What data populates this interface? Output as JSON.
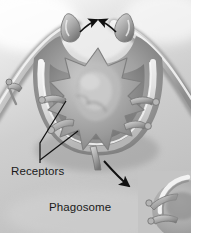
{
  "figure": {
    "kind": "scientific-illustration",
    "rendering": "grayscale-airbrush",
    "width": 200,
    "height": 233,
    "background_color": "#ffffff",
    "field_color": "#c9c9c9",
    "membrane_color": "#8f8f8f",
    "membrane_highlight_color": "#efefef",
    "particle_color": "#a6a6a6",
    "particle_shadow_color": "#6e6e6e",
    "annotation_color": "#111111",
    "label_color": "#1a1a1a"
  },
  "labels": {
    "receptors": "Receptors",
    "phagosome": "Phagosome"
  },
  "annotations": {
    "closure_arrow_left": "arrow-pointing-right-inward",
    "closure_arrow_right": "arrow-pointing-left-inward",
    "phagosome_arrow": "curved-arrow-pointing-down-right",
    "receptor_leader_upper": "leader-line-to-upper-receptor",
    "receptor_leader_lower": "leader-line-to-lower-receptor"
  },
  "structures": {
    "membrane_cup": "phagocytic-cup",
    "pseudopod_left": "left-pseudopod-tip",
    "pseudopod_right": "right-pseudopod-tip",
    "target_particle": "spiky-pathogen-particle",
    "receptors_count_visible": 8,
    "inset": "phagosome-inset-detail"
  }
}
